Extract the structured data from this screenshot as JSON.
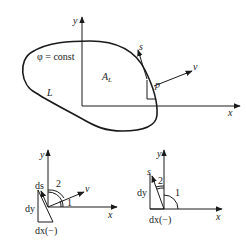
{
  "top_figure": {
    "axis_y_label": "y",
    "axis_x_label": "x",
    "contour_label": "φ = const",
    "boundary_label": "L",
    "area_label": "A",
    "area_subscript": "L",
    "point_label": "p",
    "tangent_label": "s",
    "normal_label": "v"
  },
  "bottom_left_figure": {
    "axis_y_label": "y",
    "axis_x_label": "x",
    "ds_label": "ds",
    "dy_label": "dy",
    "dx_label": "dx(−)",
    "normal_label": "v",
    "angle1_label": "1",
    "angle2_label": "2"
  },
  "bottom_right_figure": {
    "axis_y_label": "y",
    "axis_x_label": "x",
    "s_label": "s",
    "dy_label": "dy",
    "dx_label": "dx(−)",
    "angle1_label": "1",
    "angle2_label": "2"
  },
  "colors": {
    "ink": "#1a1a1a",
    "background": "#ffffff"
  }
}
